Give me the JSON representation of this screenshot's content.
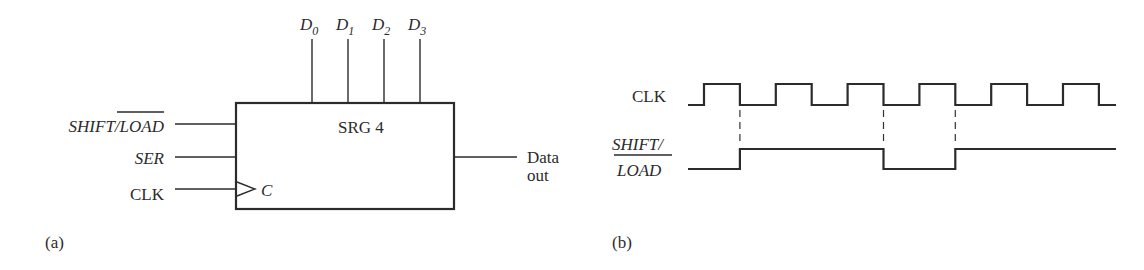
{
  "block_diagram": {
    "block_label": "SRG 4",
    "parallel_inputs": [
      {
        "name": "D",
        "sub": "0"
      },
      {
        "name": "D",
        "sub": "1"
      },
      {
        "name": "D",
        "sub": "2"
      },
      {
        "name": "D",
        "sub": "3"
      }
    ],
    "inputs": {
      "shift_prefix": "SHIFT/",
      "load_overlined": "LOAD",
      "ser": "SER",
      "clk": "CLK",
      "clock_pin": "C"
    },
    "output": {
      "line1": "Data",
      "line2": "out"
    },
    "caption": "(a)"
  },
  "timing_diagram": {
    "clk_label": "CLK",
    "shift_label_line1": "SHIFT/",
    "shift_label_line2": "LOAD",
    "caption": "(b)",
    "clk_pulses": 6,
    "shift_load_levels_per_clock_period": [
      0,
      1,
      1,
      1,
      0,
      1,
      1
    ],
    "shift_load_transitions_at_clk_falling_edges": [
      1,
      3,
      4
    ],
    "marker_dashed_lines_at_clk_falling_edges": [
      1,
      3,
      4
    ]
  }
}
